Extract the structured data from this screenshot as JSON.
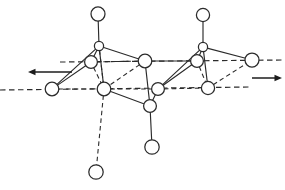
{
  "figure": {
    "canvas": {
      "width": 285,
      "height": 190
    },
    "background_color": "#ffffff",
    "line_color": "#2b2b2b",
    "atom_fill_color": "#ffffff",
    "arrow_color": "#1c1c1c"
  },
  "axes": [
    {
      "name": "upper-reference-axis",
      "x1": 60,
      "y1": 62,
      "x2": 285,
      "y2": 60,
      "style": "dashed"
    },
    {
      "name": "lower-reference-axis",
      "x1": 0,
      "y1": 90,
      "x2": 250,
      "y2": 87,
      "style": "dashed"
    }
  ],
  "atoms": [
    {
      "id": "top-left-terminal",
      "cx": 98,
      "cy": 14,
      "r": 7.0
    },
    {
      "id": "top-right-terminal",
      "cx": 203,
      "cy": 15,
      "r": 6.6
    },
    {
      "id": "left-apex",
      "cx": 99,
      "cy": 46,
      "r": 4.6
    },
    {
      "id": "right-apex",
      "cx": 203,
      "cy": 47,
      "r": 4.6
    },
    {
      "id": "left-upper-inner",
      "cx": 91,
      "cy": 62,
      "r": 6.4
    },
    {
      "id": "right-upper-inner",
      "cx": 197,
      "cy": 61,
      "r": 6.4
    },
    {
      "id": "center-upper",
      "cx": 145,
      "cy": 61,
      "r": 6.8
    },
    {
      "id": "right-outer-upper",
      "cx": 252,
      "cy": 60,
      "r": 7.0
    },
    {
      "id": "left-outer-lower",
      "cx": 52,
      "cy": 89,
      "r": 6.8
    },
    {
      "id": "left-lower-inner",
      "cx": 104,
      "cy": 89,
      "r": 6.8
    },
    {
      "id": "center-lower-inner",
      "cx": 158,
      "cy": 89,
      "r": 6.4
    },
    {
      "id": "right-lower-inner",
      "cx": 208,
      "cy": 88,
      "r": 6.6
    },
    {
      "id": "center-junction",
      "cx": 150,
      "cy": 106,
      "r": 6.4
    },
    {
      "id": "bottom-center-terminal",
      "cx": 152,
      "cy": 147,
      "r": 7.2
    },
    {
      "id": "bottom-left-terminal",
      "cx": 96,
      "cy": 172,
      "r": 7.2
    }
  ],
  "bonds_solid": [
    {
      "from": "top-left-terminal",
      "to": "left-apex"
    },
    {
      "from": "top-right-terminal",
      "to": "right-apex"
    },
    {
      "from": "left-apex",
      "to": "left-upper-inner"
    },
    {
      "from": "left-apex",
      "to": "center-upper"
    },
    {
      "from": "left-apex",
      "to": "left-outer-lower"
    },
    {
      "from": "left-apex",
      "to": "left-lower-inner"
    },
    {
      "from": "left-upper-inner",
      "to": "left-outer-lower"
    },
    {
      "from": "center-upper",
      "to": "center-junction"
    },
    {
      "from": "left-lower-inner",
      "to": "center-junction"
    },
    {
      "from": "center-junction",
      "to": "center-lower-inner"
    },
    {
      "from": "center-junction",
      "to": "bottom-center-terminal"
    },
    {
      "from": "right-apex",
      "to": "right-upper-inner"
    },
    {
      "from": "right-apex",
      "to": "right-outer-upper"
    },
    {
      "from": "right-apex",
      "to": "center-lower-inner"
    },
    {
      "from": "right-apex",
      "to": "right-lower-inner"
    },
    {
      "from": "right-upper-inner",
      "to": "center-lower-inner"
    },
    {
      "from": "center-upper",
      "to": "right-upper-inner"
    }
  ],
  "bonds_dashed": [
    {
      "from": "left-upper-inner",
      "to": "left-lower-inner"
    },
    {
      "from": "center-upper",
      "to": "left-lower-inner"
    },
    {
      "from": "left-outer-lower",
      "to": "left-lower-inner"
    },
    {
      "from": "left-lower-inner",
      "to": "center-lower-inner"
    },
    {
      "from": "left-lower-inner",
      "to": "bottom-left-terminal"
    },
    {
      "from": "left-apex",
      "to": "left-lower-inner"
    },
    {
      "from": "right-upper-inner",
      "to": "right-lower-inner"
    },
    {
      "from": "center-lower-inner",
      "to": "right-lower-inner"
    },
    {
      "from": "right-lower-inner",
      "to": "right-outer-upper"
    },
    {
      "from": "center-upper",
      "to": "left-upper-inner"
    }
  ],
  "arrows": [
    {
      "name": "left-displacement-arrow",
      "direction": "left",
      "tail_x": 72,
      "tail_y": 72,
      "tip_x": 28,
      "tip_y": 72
    },
    {
      "name": "right-displacement-arrow",
      "direction": "right",
      "tail_x": 252,
      "tail_y": 78,
      "tip_x": 282,
      "tip_y": 78
    }
  ]
}
